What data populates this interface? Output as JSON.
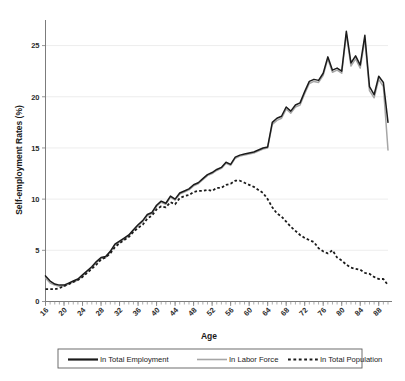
{
  "chart_data": {
    "type": "line",
    "title": "",
    "xlabel": "Age",
    "ylabel": "Self-employment Rates (%)",
    "xlim": [
      16,
      90
    ],
    "ylim": [
      0,
      27.5
    ],
    "yticks": [
      0,
      5,
      10,
      15,
      20,
      25
    ],
    "ytick_labels": [
      "0",
      "5",
      "10",
      "15",
      "20",
      "25"
    ],
    "xticks": [
      16,
      20,
      24,
      28,
      32,
      36,
      40,
      44,
      48,
      52,
      56,
      60,
      64,
      68,
      72,
      76,
      80,
      84,
      88
    ],
    "xtick_labels": [
      "16",
      "20",
      "24",
      "28",
      "32",
      "36",
      "40",
      "44",
      "48",
      "52",
      "56",
      "60",
      "64",
      "68",
      "72",
      "76",
      "80",
      "84",
      "88"
    ],
    "xtick_minor_step": 1,
    "grid": "horizontal",
    "legend_position": "bottom",
    "x": [
      16,
      17,
      18,
      19,
      20,
      21,
      22,
      23,
      24,
      25,
      26,
      27,
      28,
      29,
      30,
      31,
      32,
      33,
      34,
      35,
      36,
      37,
      38,
      39,
      40,
      41,
      42,
      43,
      44,
      45,
      46,
      47,
      48,
      49,
      50,
      51,
      52,
      53,
      54,
      55,
      56,
      57,
      58,
      59,
      60,
      61,
      62,
      63,
      64,
      65,
      66,
      67,
      68,
      69,
      70,
      71,
      72,
      73,
      74,
      75,
      76,
      77,
      78,
      79,
      80,
      81,
      82,
      83,
      84,
      85,
      86,
      87,
      88,
      89,
      90
    ],
    "series": [
      {
        "name": "In Total Employment",
        "color": "#1b1b1b",
        "style": "solid",
        "values": [
          2.5,
          2.0,
          1.7,
          1.6,
          1.6,
          1.8,
          2.0,
          2.2,
          2.6,
          3.0,
          3.4,
          3.9,
          4.3,
          4.4,
          4.9,
          5.6,
          5.9,
          6.2,
          6.5,
          7.0,
          7.5,
          7.9,
          8.5,
          8.7,
          9.4,
          9.8,
          9.6,
          10.3,
          10.0,
          10.6,
          10.8,
          11.0,
          11.4,
          11.6,
          12.0,
          12.4,
          12.6,
          12.9,
          13.1,
          13.6,
          13.4,
          14.1,
          14.3,
          14.4,
          14.5,
          14.6,
          14.8,
          15.0,
          15.1,
          17.5,
          17.9,
          18.1,
          19.0,
          18.6,
          19.2,
          19.4,
          20.5,
          21.5,
          21.7,
          21.6,
          22.3,
          23.9,
          22.6,
          22.8,
          22.5,
          26.4,
          23.3,
          24.0,
          23.1,
          26.0,
          21.0,
          20.2,
          22.0,
          21.4,
          17.5
        ]
      },
      {
        "name": "In Labor Force",
        "color": "#a6a6a6",
        "style": "solid",
        "values": [
          2.3,
          1.8,
          1.6,
          1.5,
          1.5,
          1.7,
          1.9,
          2.1,
          2.5,
          2.9,
          3.3,
          3.8,
          4.2,
          4.3,
          4.8,
          5.5,
          5.8,
          6.1,
          6.4,
          6.9,
          7.4,
          7.8,
          8.4,
          8.6,
          9.3,
          9.7,
          9.5,
          10.2,
          9.9,
          10.5,
          10.7,
          10.9,
          11.3,
          11.5,
          11.9,
          12.3,
          12.5,
          12.8,
          13.0,
          13.5,
          13.3,
          14.0,
          14.2,
          14.3,
          14.4,
          14.5,
          14.7,
          14.9,
          15.0,
          17.3,
          17.7,
          17.9,
          18.8,
          18.4,
          19.0,
          19.2,
          20.3,
          21.3,
          21.5,
          21.4,
          22.1,
          23.7,
          22.4,
          22.6,
          22.3,
          26.1,
          23.0,
          23.7,
          22.8,
          25.6,
          20.6,
          19.9,
          21.7,
          21.0,
          14.8
        ]
      },
      {
        "name": "In Total Population",
        "color": "#1b1b1b",
        "style": "dashed",
        "values": [
          1.2,
          1.2,
          1.2,
          1.3,
          1.5,
          1.7,
          1.9,
          2.1,
          2.4,
          2.8,
          3.2,
          3.6,
          4.1,
          4.3,
          4.7,
          5.3,
          5.7,
          6.0,
          6.3,
          6.8,
          7.2,
          7.5,
          8.1,
          8.4,
          9.0,
          9.3,
          9.2,
          9.7,
          9.5,
          10.1,
          10.3,
          10.4,
          10.7,
          10.8,
          10.8,
          10.9,
          10.8,
          11.1,
          11.1,
          11.4,
          11.5,
          11.8,
          11.8,
          11.6,
          11.4,
          11.2,
          10.9,
          10.6,
          10.0,
          9.2,
          8.6,
          8.3,
          7.8,
          7.3,
          6.9,
          6.5,
          6.2,
          6.0,
          5.8,
          5.2,
          4.9,
          4.7,
          5.0,
          4.3,
          4.0,
          3.6,
          3.3,
          3.2,
          3.1,
          2.8,
          2.7,
          2.4,
          2.2,
          2.2,
          1.6
        ]
      }
    ]
  },
  "legend": {
    "items": [
      {
        "label": "In Total Employment",
        "style": "solid-dark"
      },
      {
        "label": "In Labor Force",
        "style": "solid-gray"
      },
      {
        "label": "In Total Population",
        "style": "dashed"
      }
    ]
  }
}
